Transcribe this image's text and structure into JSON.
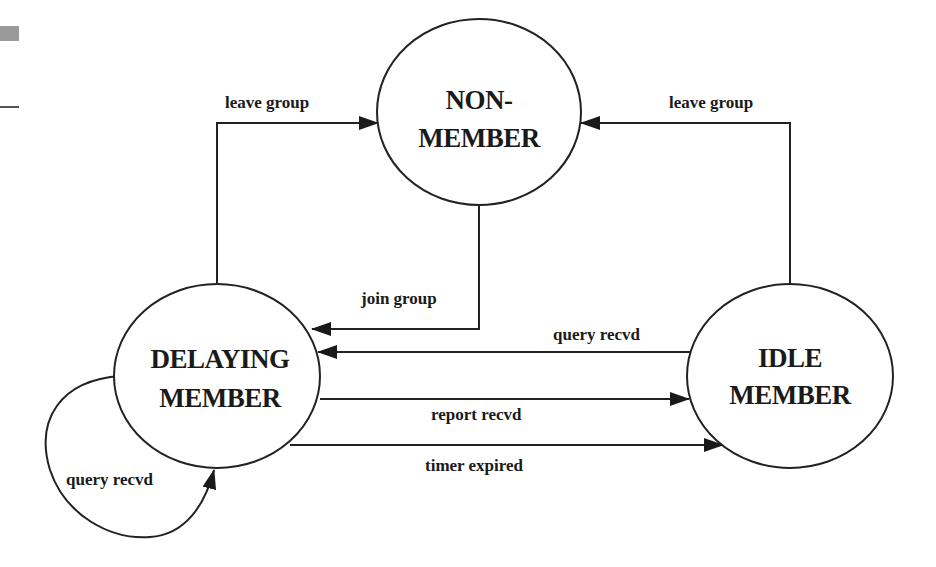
{
  "diagram": {
    "type": "state-transition",
    "states": [
      {
        "id": "non-member",
        "line1": "NON-",
        "line2": "MEMBER"
      },
      {
        "id": "delaying-member",
        "line1": "DELAYING",
        "line2": "MEMBER"
      },
      {
        "id": "idle-member",
        "line1": "IDLE",
        "line2": "MEMBER"
      }
    ],
    "transitions": [
      {
        "from": "delaying-member",
        "to": "non-member",
        "label": "leave group"
      },
      {
        "from": "idle-member",
        "to": "non-member",
        "label": "leave group"
      },
      {
        "from": "non-member",
        "to": "delaying-member",
        "label": "join group"
      },
      {
        "from": "idle-member",
        "to": "delaying-member",
        "label": "query recvd"
      },
      {
        "from": "delaying-member",
        "to": "idle-member",
        "label": "report recvd"
      },
      {
        "from": "delaying-member",
        "to": "idle-member",
        "label": "timer expired"
      },
      {
        "from": "delaying-member",
        "to": "delaying-member",
        "label": "query recvd"
      }
    ],
    "colors": {
      "line": "#222222",
      "text": "#1a1a1a",
      "background": "#ffffff",
      "scan_mark": "#999999"
    }
  }
}
